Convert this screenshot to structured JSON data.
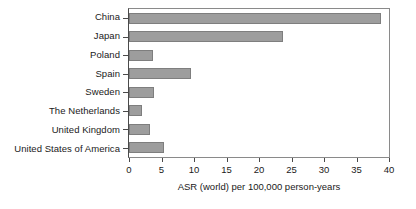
{
  "chart_data": {
    "type": "bar",
    "orientation": "horizontal",
    "title": "",
    "xlabel": "ASR (world) per 100,000 person-years",
    "ylabel": "",
    "categories": [
      "China",
      "Japan",
      "Poland",
      "Spain",
      "Sweden",
      "The Netherlands",
      "United Kingdom",
      "United States of America"
    ],
    "values": [
      38.8,
      23.7,
      3.7,
      9.5,
      3.8,
      2.0,
      3.3,
      5.4
    ],
    "xlim": [
      0,
      40
    ],
    "xticks": [
      0,
      5,
      10,
      15,
      20,
      25,
      30,
      35,
      40
    ],
    "xticklabels": [
      "0",
      "5",
      "10",
      "15",
      "20",
      "25",
      "30",
      "35",
      "40"
    ],
    "grid": false,
    "legend": false,
    "bar_color": "#9d9d9d",
    "bar_edge_color": "#7e7e7e",
    "axis_color": "#4a4a4a"
  }
}
